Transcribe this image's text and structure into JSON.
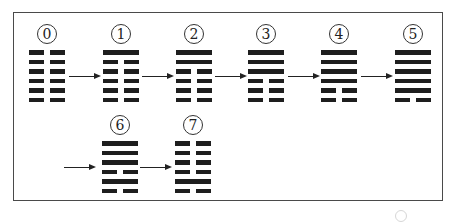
{
  "diagram": {
    "line_legend": {
      "yang": "solid line",
      "yin": "broken line"
    },
    "line_order": "top-to-bottom",
    "hexagrams": [
      {
        "label": "⓪",
        "index": 0,
        "lines": [
          "yin",
          "yin",
          "yin",
          "yin",
          "yin",
          "yin"
        ]
      },
      {
        "label": "①",
        "index": 1,
        "lines": [
          "yang",
          "yin",
          "yin",
          "yin",
          "yin",
          "yin"
        ]
      },
      {
        "label": "②",
        "index": 2,
        "lines": [
          "yang",
          "yang",
          "yin",
          "yin",
          "yin",
          "yin"
        ]
      },
      {
        "label": "③",
        "index": 3,
        "lines": [
          "yang",
          "yang",
          "yang",
          "yin",
          "yin",
          "yin"
        ]
      },
      {
        "label": "④",
        "index": 4,
        "lines": [
          "yang",
          "yang",
          "yang",
          "yang",
          "yin",
          "yin"
        ]
      },
      {
        "label": "⑤",
        "index": 5,
        "lines": [
          "yang",
          "yang",
          "yang",
          "yang",
          "yang",
          "yin"
        ]
      },
      {
        "label": "⑥",
        "index": 6,
        "lines": [
          "yang",
          "yang",
          "yang",
          "yin",
          "yang",
          "yin"
        ]
      },
      {
        "label": "⑦",
        "index": 7,
        "lines": [
          "yin",
          "yin",
          "yin",
          "yin",
          "yang",
          "yin"
        ]
      }
    ],
    "arrows": [
      {
        "from": 0,
        "to": 1
      },
      {
        "from": 1,
        "to": 2
      },
      {
        "from": 2,
        "to": 3
      },
      {
        "from": 3,
        "to": 4
      },
      {
        "from": 4,
        "to": 5
      },
      {
        "from": 5,
        "to": 6
      },
      {
        "from": 6,
        "to": 7
      }
    ],
    "colors": {
      "ink": "#1e1e1e",
      "frame": "#4a4a4a",
      "background": "#ffffff"
    }
  }
}
